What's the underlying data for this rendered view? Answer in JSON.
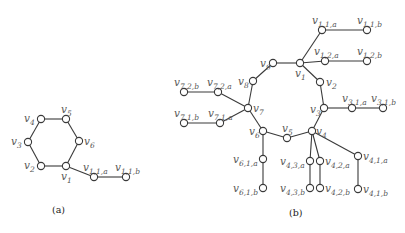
{
  "figure": {
    "panels": [
      {
        "caption": "(a)",
        "caption_pos": [
          52,
          213
        ],
        "nodes": [
          {
            "id": "v1",
            "label": "v",
            "sub": "1",
            "x": 66,
            "y": 166,
            "lx": 61,
            "ly": 180
          },
          {
            "id": "v2",
            "label": "v",
            "sub": "2",
            "x": 41,
            "y": 166,
            "lx": 24,
            "ly": 169
          },
          {
            "id": "v3",
            "label": "v",
            "sub": "3",
            "x": 28,
            "y": 142,
            "lx": 11,
            "ly": 145
          },
          {
            "id": "v4",
            "label": "v",
            "sub": "4",
            "x": 41,
            "y": 119,
            "lx": 24,
            "ly": 122
          },
          {
            "id": "v5",
            "label": "v",
            "sub": "5",
            "x": 66,
            "y": 119,
            "lx": 61,
            "ly": 113
          },
          {
            "id": "v6",
            "label": "v",
            "sub": "6",
            "x": 79,
            "y": 141,
            "lx": 84,
            "ly": 145
          },
          {
            "id": "v11a",
            "label": "v",
            "sub": "1,1,a",
            "x": 94,
            "y": 177,
            "lx": 83,
            "ly": 171
          },
          {
            "id": "v11b",
            "label": "v",
            "sub": "1,1,b",
            "x": 126,
            "y": 177,
            "lx": 115,
            "ly": 171
          }
        ],
        "edges": [
          [
            "v1",
            "v2"
          ],
          [
            "v2",
            "v3"
          ],
          [
            "v3",
            "v4"
          ],
          [
            "v4",
            "v5"
          ],
          [
            "v5",
            "v6"
          ],
          [
            "v6",
            "v1"
          ],
          [
            "v1",
            "v11a"
          ],
          [
            "v11a",
            "v11b"
          ]
        ]
      },
      {
        "caption": "(b)",
        "caption_pos": [
          289,
          216
        ],
        "nodes": [
          {
            "id": "v1",
            "label": "v",
            "sub": "1",
            "x": 300,
            "y": 63,
            "lx": 295,
            "ly": 77
          },
          {
            "id": "v2",
            "label": "v",
            "sub": "2",
            "x": 320,
            "y": 82,
            "lx": 326,
            "ly": 86
          },
          {
            "id": "v3",
            "label": "v",
            "sub": "3",
            "x": 324,
            "y": 108,
            "lx": 310,
            "ly": 113
          },
          {
            "id": "v4",
            "label": "v",
            "sub": "4",
            "x": 312,
            "y": 131,
            "lx": 316,
            "ly": 135
          },
          {
            "id": "v5",
            "label": "v",
            "sub": "5",
            "x": 287,
            "y": 138,
            "lx": 282,
            "ly": 132
          },
          {
            "id": "v6",
            "label": "v",
            "sub": "6",
            "x": 263,
            "y": 131,
            "lx": 249,
            "ly": 135
          },
          {
            "id": "v7",
            "label": "v",
            "sub": "7",
            "x": 248,
            "y": 108,
            "lx": 253,
            "ly": 112
          },
          {
            "id": "v8",
            "label": "v",
            "sub": "8",
            "x": 253,
            "y": 81,
            "lx": 238,
            "ly": 85
          },
          {
            "id": "v9",
            "label": "v",
            "sub": "9",
            "x": 273,
            "y": 63,
            "lx": 260,
            "ly": 67
          },
          {
            "id": "v11a",
            "label": "v",
            "sub": "1,1,a",
            "x": 322,
            "y": 30,
            "lx": 312,
            "ly": 24
          },
          {
            "id": "v11b",
            "label": "v",
            "sub": "1,1,b",
            "x": 367,
            "y": 30,
            "lx": 357,
            "ly": 24
          },
          {
            "id": "v12a",
            "label": "v",
            "sub": "1,2,a",
            "x": 325,
            "y": 61,
            "lx": 314,
            "ly": 55
          },
          {
            "id": "v12b",
            "label": "v",
            "sub": "1,2,b",
            "x": 367,
            "y": 61,
            "lx": 357,
            "ly": 55
          },
          {
            "id": "v31a",
            "label": "v",
            "sub": "3,1,a",
            "x": 352,
            "y": 108,
            "lx": 342,
            "ly": 102
          },
          {
            "id": "v31b",
            "label": "v",
            "sub": "3,1,b",
            "x": 383,
            "y": 108,
            "lx": 371,
            "ly": 102
          },
          {
            "id": "v72a",
            "label": "v",
            "sub": "7,2,a",
            "x": 218,
            "y": 92,
            "lx": 207,
            "ly": 86
          },
          {
            "id": "v72b",
            "label": "v",
            "sub": "7,2,b",
            "x": 184,
            "y": 92,
            "lx": 174,
            "ly": 86
          },
          {
            "id": "v71a",
            "label": "v",
            "sub": "7,1,a",
            "x": 220,
            "y": 123,
            "lx": 208,
            "ly": 117
          },
          {
            "id": "v71b",
            "label": "v",
            "sub": "7,1,b",
            "x": 184,
            "y": 123,
            "lx": 174,
            "ly": 117
          },
          {
            "id": "v61a",
            "label": "v",
            "sub": "6,1,a",
            "x": 263,
            "y": 159,
            "lx": 233,
            "ly": 163
          },
          {
            "id": "v61b",
            "label": "v",
            "sub": "6,1,b",
            "x": 263,
            "y": 188,
            "lx": 233,
            "ly": 192
          },
          {
            "id": "v43a",
            "label": "v",
            "sub": "4,3,a",
            "x": 310,
            "y": 161,
            "lx": 280,
            "ly": 165
          },
          {
            "id": "v43b",
            "label": "v",
            "sub": "4,3,b",
            "x": 310,
            "y": 188,
            "lx": 280,
            "ly": 192
          },
          {
            "id": "v42a",
            "label": "v",
            "sub": "4,2,a",
            "x": 320,
            "y": 161,
            "lx": 325,
            "ly": 165
          },
          {
            "id": "v42b",
            "label": "v",
            "sub": "4,2,b",
            "x": 320,
            "y": 188,
            "lx": 325,
            "ly": 192
          },
          {
            "id": "v41a",
            "label": "v",
            "sub": "4,1,a",
            "x": 358,
            "y": 156,
            "lx": 363,
            "ly": 160
          },
          {
            "id": "v41b",
            "label": "v",
            "sub": "4,1,b",
            "x": 358,
            "y": 189,
            "lx": 363,
            "ly": 193
          }
        ],
        "edges": [
          [
            "v1",
            "v2"
          ],
          [
            "v2",
            "v3"
          ],
          [
            "v3",
            "v4"
          ],
          [
            "v4",
            "v5"
          ],
          [
            "v5",
            "v6"
          ],
          [
            "v6",
            "v7"
          ],
          [
            "v7",
            "v8"
          ],
          [
            "v8",
            "v9"
          ],
          [
            "v9",
            "v1"
          ],
          [
            "v1",
            "v11a"
          ],
          [
            "v11a",
            "v11b"
          ],
          [
            "v1",
            "v12a"
          ],
          [
            "v12a",
            "v12b"
          ],
          [
            "v3",
            "v31a"
          ],
          [
            "v31a",
            "v31b"
          ],
          [
            "v7",
            "v72a"
          ],
          [
            "v72a",
            "v72b"
          ],
          [
            "v7",
            "v71a"
          ],
          [
            "v71a",
            "v71b"
          ],
          [
            "v6",
            "v61a"
          ],
          [
            "v61a",
            "v61b"
          ],
          [
            "v4",
            "v43a"
          ],
          [
            "v43a",
            "v43b"
          ],
          [
            "v4",
            "v42a"
          ],
          [
            "v42a",
            "v42b"
          ],
          [
            "v4",
            "v41a"
          ],
          [
            "v41a",
            "v41b"
          ]
        ]
      }
    ]
  }
}
